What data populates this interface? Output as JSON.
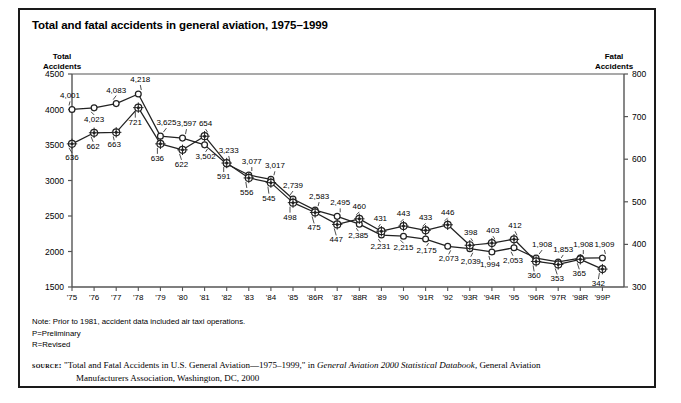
{
  "title": "Total and fatal accidents in general aviation, 1975–1999",
  "axis_headers": {
    "left": "Total\nAccidents",
    "left_line1": "Total",
    "left_line2": "Accidents",
    "right_line1": "Fatal",
    "right_line2": "Accidents"
  },
  "notes": {
    "note": "Note: Prior to 1981, accident data included air taxi operations.",
    "p": "P=Preliminary",
    "r": "R=Revised"
  },
  "source": {
    "label": "source:",
    "line1_pre": " \"Total and Fatal Accidents in U.S. General Aviation—1975–1999,\" in ",
    "line1_italic": "General Aviation 2000 Statistical Databook",
    "line1_post": ", General Aviation",
    "line2": "Manufacturers Association, Washington, DC, 2000"
  },
  "chart_data": {
    "type": "line",
    "title": "Total and fatal accidents in general aviation, 1975–1999",
    "xlabel": "",
    "ylabel": "Total Accidents",
    "y2label": "Fatal Accidents",
    "ylim": [
      1500,
      4500
    ],
    "y2lim": [
      300,
      800
    ],
    "yticks": [
      1500,
      2000,
      2500,
      3000,
      3500,
      4000,
      4500
    ],
    "y2ticks": [
      300,
      400,
      500,
      600,
      700,
      800
    ],
    "grid": false,
    "legend": "none",
    "categories": [
      "'75",
      "'76",
      "'77",
      "'78",
      "'79",
      "'80",
      "'81",
      "'82",
      "'83",
      "'84",
      "'85",
      "'86R",
      "'87",
      "'88R",
      "'89",
      "'90",
      "'91R",
      "'92",
      "'93R",
      "'94R",
      "'95",
      "'96R",
      "'97R",
      "'98R",
      "'99P"
    ],
    "series": [
      {
        "name": "Total Accidents",
        "axis": "left",
        "marker": "open-circle",
        "values": [
          4001,
          4023,
          4083,
          4218,
          3625,
          3597,
          3502,
          3233,
          3077,
          3017,
          2739,
          2583,
          2495,
          2385,
          2231,
          2215,
          2175,
          2073,
          2039,
          1994,
          2053,
          1908,
          1853,
          1908,
          1909
        ],
        "labels": [
          "4,001",
          "4,023",
          "4,083",
          "4,218",
          "3,625",
          "3,597",
          "3,502",
          "3,233",
          "3,077",
          "3,017",
          "2,739",
          "2,583",
          "2,495",
          "2,385",
          "2,231",
          "2,215",
          "2,175",
          "2,073",
          "2,039",
          "1,994",
          "2,053",
          "1,908",
          "1,853",
          "1,908",
          "1,909"
        ]
      },
      {
        "name": "Fatal Accidents",
        "axis": "right",
        "marker": "filled-circle",
        "values": [
          636,
          662,
          663,
          721,
          636,
          622,
          654,
          591,
          556,
          545,
          498,
          475,
          447,
          460,
          431,
          443,
          433,
          446,
          398,
          403,
          412,
          360,
          353,
          365,
          342
        ],
        "labels": [
          "636",
          "662",
          "663",
          "721",
          "636",
          "622",
          "654",
          "591",
          "556",
          "545",
          "498",
          "475",
          "447",
          "460",
          "431",
          "443",
          "433",
          "446",
          "398",
          "403",
          "412",
          "360",
          "353",
          "365",
          "342"
        ]
      }
    ]
  },
  "label_offsets": {
    "total": [
      {
        "dx": -2,
        "dy": -13
      },
      {
        "dx": 0,
        "dy": 12
      },
      {
        "dx": 0,
        "dy": -13
      },
      {
        "dx": 2,
        "dy": -14
      },
      {
        "dx": 6,
        "dy": -13
      },
      {
        "dx": 4,
        "dy": -14
      },
      {
        "dx": 1,
        "dy": 12
      },
      {
        "dx": 2,
        "dy": -13
      },
      {
        "dx": 3,
        "dy": -13
      },
      {
        "dx": 4,
        "dy": -13
      },
      {
        "dx": 0,
        "dy": -13
      },
      {
        "dx": 4,
        "dy": -13
      },
      {
        "dx": 3,
        "dy": -13
      },
      {
        "dx": -1,
        "dy": 12
      },
      {
        "dx": -1,
        "dy": 12
      },
      {
        "dx": 0,
        "dy": 12
      },
      {
        "dx": 1,
        "dy": 12
      },
      {
        "dx": 1,
        "dy": 13
      },
      {
        "dx": 1,
        "dy": 13
      },
      {
        "dx": -2,
        "dy": 13
      },
      {
        "dx": -1,
        "dy": 13
      },
      {
        "dx": 6,
        "dy": -13
      },
      {
        "dx": 5,
        "dy": -12
      },
      {
        "dx": 3,
        "dy": -13
      },
      {
        "dx": 2,
        "dy": -13
      }
    ],
    "fatal": [
      {
        "dx": 0,
        "dy": 14
      },
      {
        "dx": -1,
        "dy": 14
      },
      {
        "dx": -2,
        "dy": 13
      },
      {
        "dx": -3,
        "dy": 15
      },
      {
        "dx": -3,
        "dy": 15
      },
      {
        "dx": -1,
        "dy": 15
      },
      {
        "dx": 1,
        "dy": -12
      },
      {
        "dx": -3,
        "dy": 14
      },
      {
        "dx": -2,
        "dy": 15
      },
      {
        "dx": -2,
        "dy": 16
      },
      {
        "dx": -3,
        "dy": 15
      },
      {
        "dx": -1,
        "dy": 16
      },
      {
        "dx": -1,
        "dy": 16
      },
      {
        "dx": 0,
        "dy": -12
      },
      {
        "dx": -1,
        "dy": -12
      },
      {
        "dx": 0,
        "dy": -12
      },
      {
        "dx": 0,
        "dy": -12
      },
      {
        "dx": 0,
        "dy": -12
      },
      {
        "dx": 1,
        "dy": -12
      },
      {
        "dx": 1,
        "dy": -12
      },
      {
        "dx": 1,
        "dy": -13
      },
      {
        "dx": -2,
        "dy": 15
      },
      {
        "dx": -1,
        "dy": 15
      },
      {
        "dx": -1,
        "dy": 15
      },
      {
        "dx": -4,
        "dy": 15
      }
    ]
  },
  "geometry": {
    "x0": 52,
    "dx": 22.1,
    "ytop": 64,
    "ybot": 277,
    "plot_right": 604
  },
  "colors": {
    "ink": "#1a1a1a",
    "axis": "#555555",
    "line": "#222222"
  }
}
